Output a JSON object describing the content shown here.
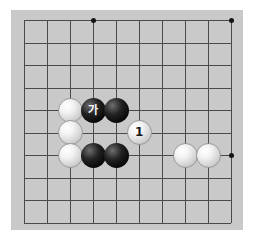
{
  "image": {
    "kind": "go-board-diagram",
    "width": 254,
    "height": 240,
    "page_background": "#ffffff"
  },
  "board": {
    "name": "go-board",
    "background_color": "#c9c9c9",
    "line_color": "#4a4a4a",
    "star_color": "#141414",
    "left": 11,
    "top": 10,
    "width": 232,
    "height": 220,
    "grid": {
      "origin_x": 24,
      "origin_y": 20,
      "spacing_x": 23,
      "spacing_y": 22.5,
      "columns": 10,
      "rows": 10,
      "column_x": [
        24,
        47,
        70,
        93,
        116,
        139,
        162,
        185,
        208,
        231
      ],
      "row_y": [
        20,
        42.5,
        65,
        87.5,
        110,
        132.5,
        155,
        177.5,
        200,
        222.5
      ],
      "line_width": 1
    },
    "star_points": [
      {
        "name": "star-point-top-left",
        "col": 3,
        "row": 0,
        "x": 93,
        "y": 20,
        "size": 5
      },
      {
        "name": "star-point-top-right",
        "col": 9,
        "row": 0,
        "x": 231,
        "y": 20,
        "size": 5
      },
      {
        "name": "star-point-right",
        "col": 9,
        "row": 6,
        "x": 231,
        "y": 155,
        "size": 5
      }
    ]
  },
  "stones": [
    {
      "name": "stone-white-a",
      "color": "white",
      "col": 2,
      "row": 4,
      "x": 70,
      "y": 110,
      "label": ""
    },
    {
      "name": "stone-black-ga",
      "color": "black",
      "col": 3,
      "row": 4,
      "x": 93,
      "y": 110,
      "label": "가"
    },
    {
      "name": "stone-black-b",
      "color": "black",
      "col": 4,
      "row": 4,
      "x": 116,
      "y": 110,
      "label": ""
    },
    {
      "name": "stone-white-b",
      "color": "white",
      "col": 2,
      "row": 5,
      "x": 70,
      "y": 132,
      "label": ""
    },
    {
      "name": "stone-white-move-1",
      "color": "white",
      "col": 5,
      "row": 5,
      "x": 139,
      "y": 132,
      "label": "1"
    },
    {
      "name": "stone-white-c",
      "color": "white",
      "col": 2,
      "row": 6,
      "x": 70,
      "y": 155,
      "label": ""
    },
    {
      "name": "stone-black-c",
      "color": "black",
      "col": 3,
      "row": 6,
      "x": 93,
      "y": 155,
      "label": ""
    },
    {
      "name": "stone-black-d",
      "color": "black",
      "col": 4,
      "row": 6,
      "x": 116,
      "y": 155,
      "label": ""
    },
    {
      "name": "stone-white-d",
      "color": "white",
      "col": 7,
      "row": 6,
      "x": 185,
      "y": 155,
      "label": ""
    },
    {
      "name": "stone-white-e",
      "color": "white",
      "col": 8,
      "row": 6,
      "x": 208,
      "y": 155,
      "label": ""
    }
  ],
  "stone_style": {
    "diameter": 25,
    "white_fill": "#f2f2f2",
    "white_edge": "#9a9a9a",
    "black_fill": "#0a0a0a",
    "black_label_color": "#ffffff",
    "white_label_color": "#1a1a1a"
  }
}
